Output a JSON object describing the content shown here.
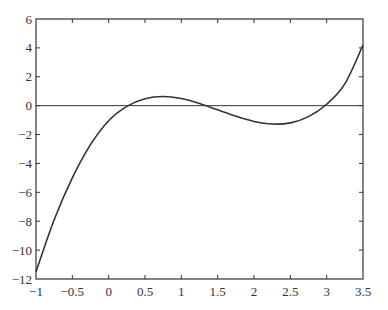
{
  "chart_data": {
    "type": "line",
    "title": "",
    "xlabel": "",
    "ylabel": "",
    "xlim": [
      -1,
      3.5
    ],
    "ylim": [
      -12,
      6
    ],
    "grid": false,
    "legend": null,
    "x_ticks": [
      -1,
      -0.5,
      0,
      0.5,
      1,
      1.5,
      2,
      2.5,
      3,
      3.5
    ],
    "x_tick_labels": [
      "-1",
      "-0.5",
      "0",
      "0.5",
      "1",
      "1.5",
      "2",
      "2.5",
      "3",
      "3.5"
    ],
    "y_ticks": [
      -12,
      -10,
      -8,
      -6,
      -4,
      -2,
      0,
      2,
      4,
      6
    ],
    "y_tick_labels": [
      "-12",
      "-10",
      "-8",
      "-6",
      "-4",
      "-2",
      "0",
      "2",
      "4",
      "6"
    ],
    "reference_lines": [
      {
        "type": "horizontal",
        "y": 0
      }
    ],
    "series": [
      {
        "name": "f(x)",
        "description": "cubic with roots near 0.27, 1.33, 2.9",
        "x": [
          -1,
          -0.75,
          -0.5,
          -0.25,
          0,
          0.25,
          0.5,
          0.75,
          1,
          1.25,
          1.5,
          1.75,
          2,
          2.25,
          2.5,
          2.75,
          3,
          3.25,
          3.5
        ],
        "y": [
          -11.5,
          -7.9,
          -5.0,
          -2.7,
          -1.04,
          -0.05,
          0.48,
          0.63,
          0.49,
          0.15,
          -0.29,
          -0.73,
          -1.09,
          -1.27,
          -1.19,
          -0.76,
          0.1,
          1.51,
          4.2
        ]
      }
    ],
    "line_color": "#333333"
  }
}
